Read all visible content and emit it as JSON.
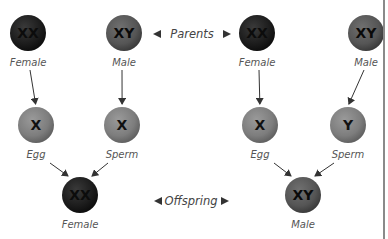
{
  "diagram": {
    "center_labels": {
      "parents": "Parents",
      "offspring": "Offspring"
    },
    "colors": {
      "dark_circle": "#1c1c1c",
      "medium_circle": "#555555",
      "light_circle": "#7d7d7d",
      "arrow": "#333333"
    },
    "crosses": [
      {
        "parents": [
          {
            "chromosomes": "XX",
            "label": "Female",
            "tone": "dark"
          },
          {
            "chromosomes": "XY",
            "label": "Male",
            "tone": "medium"
          }
        ],
        "gametes": [
          {
            "chromosomes": "X",
            "label": "Egg",
            "tone": "light"
          },
          {
            "chromosomes": "X",
            "label": "Sperm",
            "tone": "light"
          }
        ],
        "offspring": {
          "chromosomes": "XX",
          "label": "Female",
          "tone": "dark"
        }
      },
      {
        "parents": [
          {
            "chromosomes": "XX",
            "label": "Female",
            "tone": "dark"
          },
          {
            "chromosomes": "XY",
            "label": "Male",
            "tone": "medium"
          }
        ],
        "gametes": [
          {
            "chromosomes": "X",
            "label": "Egg",
            "tone": "light"
          },
          {
            "chromosomes": "Y",
            "label": "Sperm",
            "tone": "light"
          }
        ],
        "offspring": {
          "chromosomes": "XY",
          "label": "Male",
          "tone": "medium"
        }
      }
    ]
  }
}
